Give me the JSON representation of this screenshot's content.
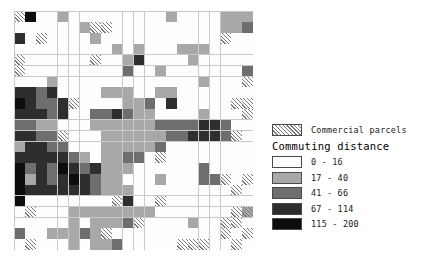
{
  "chart_data": {
    "type": "heatmap",
    "title": "",
    "xlabel": "",
    "ylabel": "",
    "grid": true,
    "legend_position": "right",
    "rows": 22,
    "cols": 22,
    "class_codes": [
      0,
      1,
      2,
      3,
      4
    ],
    "class_labels": [
      "0 - 16",
      "17 - 40",
      "41 - 66",
      "67 - 114",
      "115 - 200"
    ],
    "class_colors": [
      "#fdfdfd",
      "#a8a8a8",
      "#6e6e6e",
      "#2e2e2e",
      "#0d0d0d"
    ],
    "overlay_name": "Commercial parcels",
    "overlay_pattern": "diagonal-hatch",
    "values": [
      [
        0,
        4,
        0,
        0,
        1,
        0,
        0,
        0,
        0,
        0,
        0,
        0,
        0,
        0,
        1,
        0,
        0,
        0,
        0,
        1,
        1,
        1
      ],
      [
        0,
        0,
        0,
        0,
        0,
        0,
        1,
        0,
        0,
        0,
        0,
        0,
        0,
        0,
        0,
        0,
        0,
        0,
        0,
        1,
        1,
        2
      ],
      [
        3,
        0,
        0,
        0,
        0,
        0,
        0,
        1,
        0,
        0,
        0,
        0,
        0,
        0,
        0,
        0,
        0,
        0,
        0,
        0,
        0,
        0
      ],
      [
        0,
        0,
        0,
        0,
        0,
        0,
        0,
        0,
        0,
        1,
        0,
        1,
        0,
        0,
        0,
        1,
        1,
        1,
        0,
        0,
        0,
        0
      ],
      [
        0,
        0,
        0,
        0,
        0,
        0,
        0,
        0,
        0,
        0,
        1,
        3,
        0,
        0,
        0,
        0,
        1,
        0,
        0,
        0,
        0,
        0
      ],
      [
        0,
        0,
        0,
        0,
        0,
        0,
        0,
        0,
        0,
        0,
        2,
        0,
        0,
        1,
        0,
        0,
        0,
        0,
        0,
        0,
        0,
        2
      ],
      [
        0,
        0,
        0,
        1,
        0,
        0,
        0,
        0,
        0,
        0,
        0,
        0,
        0,
        0,
        0,
        0,
        0,
        1,
        0,
        0,
        0,
        0
      ],
      [
        3,
        3,
        2,
        3,
        0,
        0,
        0,
        0,
        1,
        1,
        1,
        0,
        0,
        1,
        1,
        0,
        0,
        0,
        0,
        0,
        0,
        0
      ],
      [
        4,
        3,
        2,
        2,
        3,
        0,
        0,
        0,
        0,
        0,
        1,
        1,
        2,
        0,
        3,
        0,
        0,
        0,
        0,
        0,
        0,
        0
      ],
      [
        3,
        3,
        3,
        2,
        3,
        0,
        0,
        2,
        2,
        3,
        2,
        1,
        1,
        0,
        0,
        0,
        0,
        1,
        0,
        0,
        0,
        0
      ],
      [
        2,
        2,
        1,
        1,
        0,
        0,
        0,
        1,
        1,
        1,
        1,
        1,
        1,
        2,
        2,
        2,
        2,
        3,
        3,
        2,
        0,
        0
      ],
      [
        3,
        3,
        2,
        2,
        0,
        0,
        0,
        0,
        1,
        1,
        1,
        1,
        1,
        1,
        2,
        2,
        3,
        3,
        3,
        2,
        0,
        0
      ],
      [
        1,
        3,
        3,
        2,
        2,
        0,
        0,
        0,
        1,
        1,
        1,
        1,
        1,
        2,
        0,
        0,
        0,
        0,
        0,
        0,
        0,
        0
      ],
      [
        3,
        3,
        3,
        3,
        3,
        2,
        1,
        0,
        1,
        1,
        2,
        2,
        0,
        0,
        0,
        0,
        0,
        0,
        0,
        0,
        0,
        0
      ],
      [
        4,
        2,
        3,
        2,
        4,
        3,
        2,
        3,
        1,
        1,
        1,
        0,
        0,
        0,
        0,
        0,
        0,
        2,
        0,
        0,
        0,
        0
      ],
      [
        4,
        1,
        3,
        2,
        3,
        4,
        3,
        2,
        1,
        1,
        0,
        0,
        0,
        1,
        0,
        0,
        0,
        2,
        2,
        0,
        0,
        0
      ],
      [
        4,
        3,
        3,
        3,
        3,
        3,
        3,
        2,
        1,
        1,
        1,
        0,
        0,
        0,
        0,
        0,
        0,
        0,
        0,
        0,
        0,
        0
      ],
      [
        4,
        0,
        0,
        0,
        0,
        0,
        0,
        0,
        0,
        0,
        3,
        0,
        0,
        0,
        0,
        0,
        0,
        0,
        0,
        0,
        0,
        0
      ],
      [
        0,
        0,
        0,
        0,
        0,
        1,
        1,
        1,
        1,
        1,
        1,
        1,
        1,
        0,
        0,
        0,
        0,
        0,
        0,
        0,
        0,
        1
      ],
      [
        0,
        0,
        0,
        0,
        0,
        1,
        0,
        1,
        1,
        1,
        2,
        0,
        0,
        0,
        0,
        0,
        1,
        0,
        0,
        0,
        0,
        0
      ],
      [
        2,
        0,
        0,
        1,
        1,
        1,
        2,
        1,
        0,
        0,
        0,
        0,
        0,
        0,
        0,
        0,
        0,
        0,
        0,
        0,
        0,
        0
      ],
      [
        0,
        0,
        0,
        0,
        0,
        1,
        0,
        1,
        1,
        2,
        0,
        0,
        0,
        0,
        0,
        0,
        0,
        0,
        0,
        0,
        0,
        0
      ]
    ],
    "commercial": [
      [
        1,
        0,
        0,
        0,
        0,
        0,
        0,
        0,
        0,
        0,
        0,
        0,
        0,
        0,
        0,
        0,
        0,
        0,
        0,
        0,
        0,
        0
      ],
      [
        0,
        0,
        0,
        0,
        0,
        0,
        0,
        1,
        1,
        0,
        0,
        0,
        0,
        0,
        0,
        0,
        0,
        0,
        0,
        0,
        0,
        0
      ],
      [
        0,
        0,
        1,
        0,
        0,
        0,
        0,
        0,
        0,
        0,
        0,
        0,
        0,
        0,
        0,
        0,
        0,
        0,
        0,
        1,
        0,
        0
      ],
      [
        0,
        0,
        0,
        0,
        0,
        0,
        0,
        0,
        0,
        0,
        0,
        0,
        0,
        0,
        0,
        0,
        0,
        0,
        0,
        0,
        0,
        0
      ],
      [
        1,
        0,
        0,
        0,
        0,
        0,
        0,
        1,
        0,
        0,
        0,
        0,
        0,
        0,
        0,
        0,
        0,
        0,
        0,
        0,
        0,
        0
      ],
      [
        1,
        0,
        0,
        0,
        0,
        0,
        0,
        0,
        0,
        0,
        0,
        0,
        0,
        0,
        0,
        0,
        0,
        0,
        0,
        0,
        0,
        0
      ],
      [
        0,
        0,
        0,
        0,
        0,
        0,
        0,
        0,
        0,
        0,
        0,
        0,
        0,
        0,
        0,
        0,
        0,
        0,
        0,
        0,
        0,
        1
      ],
      [
        0,
        0,
        0,
        0,
        0,
        0,
        0,
        0,
        0,
        0,
        0,
        0,
        0,
        0,
        0,
        0,
        0,
        0,
        0,
        0,
        0,
        0
      ],
      [
        0,
        0,
        0,
        0,
        0,
        1,
        0,
        0,
        0,
        0,
        0,
        0,
        0,
        0,
        0,
        0,
        0,
        0,
        0,
        0,
        1,
        1
      ],
      [
        0,
        0,
        0,
        0,
        0,
        0,
        0,
        0,
        0,
        0,
        0,
        0,
        0,
        0,
        0,
        0,
        0,
        0,
        0,
        0,
        0,
        1
      ],
      [
        0,
        0,
        0,
        0,
        0,
        0,
        0,
        0,
        0,
        0,
        0,
        0,
        0,
        0,
        0,
        0,
        0,
        0,
        0,
        0,
        0,
        0
      ],
      [
        0,
        0,
        0,
        0,
        1,
        0,
        0,
        0,
        0,
        0,
        0,
        0,
        0,
        0,
        0,
        0,
        0,
        0,
        0,
        0,
        1,
        0
      ],
      [
        0,
        0,
        0,
        0,
        0,
        0,
        0,
        0,
        0,
        0,
        0,
        0,
        0,
        0,
        0,
        0,
        0,
        0,
        0,
        0,
        0,
        0
      ],
      [
        0,
        0,
        0,
        0,
        0,
        0,
        0,
        0,
        0,
        0,
        0,
        0,
        0,
        1,
        0,
        0,
        0,
        0,
        0,
        0,
        0,
        0
      ],
      [
        0,
        0,
        0,
        0,
        0,
        0,
        0,
        0,
        0,
        0,
        0,
        0,
        0,
        0,
        0,
        0,
        0,
        0,
        0,
        0,
        0,
        0
      ],
      [
        0,
        0,
        0,
        0,
        0,
        0,
        0,
        0,
        0,
        0,
        0,
        0,
        0,
        0,
        0,
        0,
        0,
        0,
        0,
        1,
        0,
        1
      ],
      [
        0,
        0,
        0,
        0,
        0,
        0,
        0,
        0,
        0,
        0,
        0,
        0,
        0,
        0,
        0,
        0,
        0,
        0,
        0,
        0,
        1,
        0
      ],
      [
        0,
        0,
        0,
        0,
        0,
        0,
        0,
        0,
        0,
        1,
        0,
        0,
        0,
        1,
        0,
        0,
        0,
        0,
        0,
        0,
        0,
        0
      ],
      [
        0,
        1,
        0,
        0,
        0,
        0,
        0,
        0,
        0,
        0,
        0,
        0,
        0,
        0,
        0,
        0,
        0,
        0,
        0,
        0,
        1,
        1
      ],
      [
        0,
        0,
        0,
        0,
        0,
        0,
        0,
        0,
        0,
        0,
        0,
        1,
        0,
        0,
        0,
        0,
        0,
        0,
        0,
        1,
        1,
        0
      ],
      [
        0,
        0,
        0,
        0,
        0,
        0,
        0,
        0,
        1,
        0,
        0,
        0,
        0,
        0,
        0,
        0,
        0,
        0,
        0,
        1,
        0,
        1
      ],
      [
        0,
        1,
        0,
        0,
        0,
        0,
        0,
        0,
        0,
        0,
        0,
        0,
        0,
        0,
        0,
        1,
        1,
        1,
        0,
        0,
        1,
        0
      ]
    ]
  },
  "legend": {
    "commercial": {
      "label": "Commercial parcels"
    },
    "commuting": {
      "title": "Commuting distance",
      "classes": [
        {
          "label": "0 - 16",
          "color": "#fdfdfd"
        },
        {
          "label": "17 - 40",
          "color": "#a8a8a8"
        },
        {
          "label": "41 - 66",
          "color": "#6e6e6e"
        },
        {
          "label": "67 - 114",
          "color": "#2e2e2e"
        },
        {
          "label": "115 - 200",
          "color": "#0d0d0d"
        }
      ]
    }
  }
}
